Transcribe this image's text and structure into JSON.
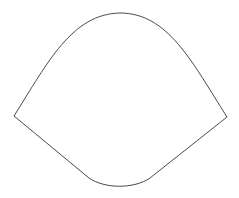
{
  "canvas": {
    "width": 239,
    "height": 198,
    "background_color": "#ffffff"
  },
  "figure": {
    "name": "closed-outline-shape",
    "stroke_color": "#4a4a4a",
    "fill_color": "none",
    "stroke_width": 1,
    "vertices": {
      "top_apex": {
        "x": 120,
        "y": 13
      },
      "left_corner": {
        "x": 14,
        "y": 116
      },
      "right_corner": {
        "x": 227,
        "y": 117
      },
      "bottom_apex": {
        "x": 120,
        "y": 188
      }
    },
    "segments": [
      {
        "name": "left-upper-curve",
        "type": "curve",
        "from": {
          "x": 14,
          "y": 116
        },
        "to": {
          "x": 120,
          "y": 13
        },
        "control_1": {
          "x": 48,
          "y": 62
        },
        "control_2": {
          "x": 72,
          "y": 14
        }
      },
      {
        "name": "right-upper-curve",
        "type": "curve",
        "from": {
          "x": 120,
          "y": 13
        },
        "to": {
          "x": 227,
          "y": 117
        },
        "control_1": {
          "x": 168,
          "y": 13
        },
        "control_2": {
          "x": 192,
          "y": 62
        }
      },
      {
        "name": "right-lower-edge",
        "type": "line",
        "from": {
          "x": 227,
          "y": 117
        },
        "to": {
          "x": 150,
          "y": 178
        }
      },
      {
        "name": "bottom-curve",
        "type": "curve",
        "from": {
          "x": 150,
          "y": 178
        },
        "to": {
          "x": 89,
          "y": 178
        },
        "control_1": {
          "x": 134,
          "y": 189
        },
        "control_2": {
          "x": 105,
          "y": 189
        }
      },
      {
        "name": "left-lower-edge",
        "type": "line",
        "from": {
          "x": 89,
          "y": 178
        },
        "to": {
          "x": 14,
          "y": 116
        }
      }
    ],
    "path_d": "M 14 116 C 48 62 72 14 120 13 C 168 13 192 62 227 117 L 150 178 C 134 189 105 189 89 178 L 14 116 Z"
  }
}
